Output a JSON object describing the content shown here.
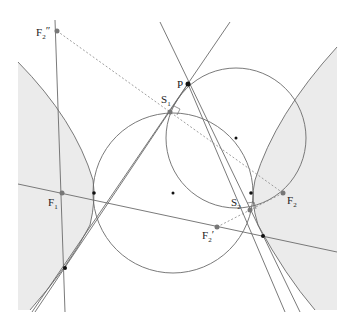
{
  "diagram": {
    "type": "geometry-hyperbola-tangent-circles",
    "colors": {
      "background": "#ffffff",
      "shade": "#ebebeb",
      "line": "#6b6b6b",
      "dashed": "#888888",
      "point_dark": "#111111",
      "point_gray": "#777777"
    },
    "labels": {
      "F1": {
        "main": "F",
        "sub": "1",
        "prime": ""
      },
      "F2": {
        "main": "F",
        "sub": "2",
        "prime": ""
      },
      "F2p": {
        "main": "F",
        "sub": "2",
        "prime": "′"
      },
      "F2pp": {
        "main": "F",
        "sub": "2",
        "prime": "″"
      },
      "S1": {
        "main": "S",
        "sub": "1",
        "prime": ""
      },
      "S2": {
        "main": "S",
        "sub": "2",
        "prime": ""
      },
      "P": {
        "main": "P",
        "sub": "",
        "prime": ""
      }
    },
    "points": {
      "F1": [
        62,
        193
      ],
      "F2": [
        283,
        193
      ],
      "F2p": [
        217,
        227
      ],
      "F2pp": [
        57,
        31
      ],
      "S1": [
        170,
        112
      ],
      "S2": [
        250,
        210
      ],
      "P": [
        188,
        84
      ],
      "center_big_circle": [
        173,
        193
      ],
      "center_small_circle": [
        236,
        138
      ],
      "left_vertex": [
        94,
        193
      ],
      "right_vertex": [
        251,
        193
      ],
      "tangent_left_lower": [
        65,
        268
      ],
      "tangent_right_lower": [
        263,
        236
      ]
    }
  }
}
